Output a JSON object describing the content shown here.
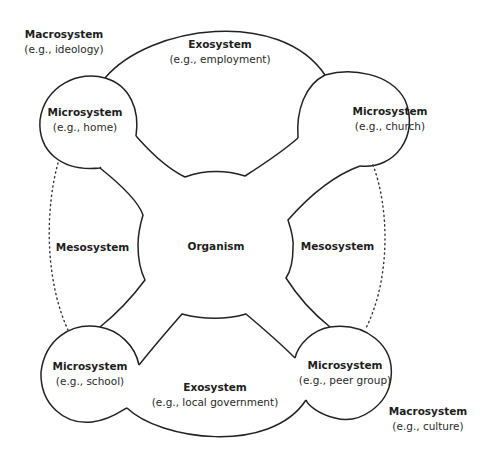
{
  "diagram": {
    "type": "ecological-systems-model",
    "center": {
      "title": "Organism"
    },
    "macrosystem_top": {
      "title": "Macrosystem",
      "example": "(e.g., ideology)"
    },
    "macrosystem_bottom": {
      "title": "Macrosystem",
      "example": "(e.g., culture)"
    },
    "exosystem_top": {
      "title": "Exosystem",
      "example": "(e.g., employment)"
    },
    "exosystem_bottom": {
      "title": "Exosystem",
      "example": "(e.g., local government)"
    },
    "mesosystem_left": {
      "title": "Mesosystem"
    },
    "mesosystem_right": {
      "title": "Mesosystem"
    },
    "microsystems": [
      {
        "position": "top-left",
        "title": "Microsystem",
        "example": "(e.g., home)"
      },
      {
        "position": "top-right",
        "title": "Microsystem",
        "example": "(e.g., church)"
      },
      {
        "position": "bottom-left",
        "title": "Microsystem",
        "example": "(e.g., school)"
      },
      {
        "position": "bottom-right",
        "title": "Microsystem",
        "example": "(e.g., peer group)"
      }
    ],
    "colors": {
      "line": "#222222",
      "background": "#ffffff"
    }
  }
}
